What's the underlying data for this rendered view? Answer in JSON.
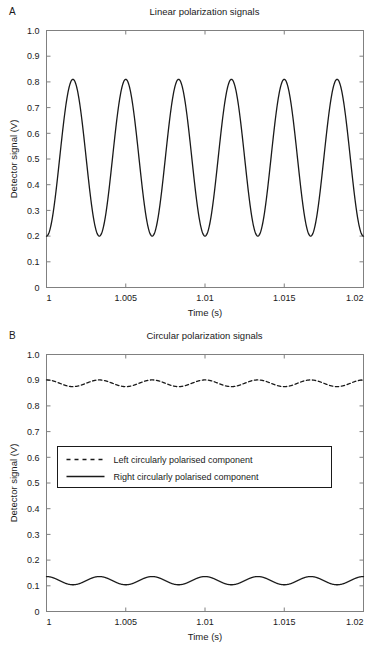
{
  "figure": {
    "width": 377,
    "height": 646,
    "background": "#ffffff",
    "line_color": "#1a1a1a",
    "axis_color": "#808080",
    "text_color": "#1a1a1a"
  },
  "panels": [
    {
      "label": "A",
      "title": "Linear polarization signals",
      "xlabel": "Time (s)",
      "ylabel": "Detector signal (V)"
    },
    {
      "label": "B",
      "title": "Circular polarization signals",
      "xlabel": "Time (s)",
      "ylabel": "Detector signal (V)"
    }
  ],
  "legend": {
    "items": [
      {
        "label": "Left circularly polarised component",
        "style": "dashed"
      },
      {
        "label": "Right circularly polarised component",
        "style": "solid"
      }
    ]
  },
  "chart_data": [
    {
      "type": "line",
      "panel": "A",
      "title": "Linear polarization signals",
      "xlabel": "Time (s)",
      "ylabel": "Detector signal (V)",
      "xlim": [
        1,
        1.02
      ],
      "ylim": [
        0,
        1.0
      ],
      "xticks": [
        1,
        1.005,
        1.01,
        1.015,
        1.02
      ],
      "xticklabels": [
        "1",
        "1.005",
        "1.01",
        "1.015",
        "1.02"
      ],
      "yticks": [
        0,
        0.1,
        0.2,
        0.3,
        0.4,
        0.5,
        0.6,
        0.7,
        0.8,
        0.9,
        1.0
      ],
      "yticklabels": [
        "0",
        "0.1",
        "0.2",
        "0.3",
        "0.4",
        "0.5",
        "0.6",
        "0.7",
        "0.8",
        "0.9",
        "1.0"
      ],
      "grid": false,
      "legend": "none",
      "series": [
        {
          "name": "Linear polarization detector signal",
          "style": "solid",
          "color": "#1a1a1a",
          "model": "sinusoid",
          "offset": 0.505,
          "amplitude": 0.305,
          "cycles": 6,
          "phase_deg": -90,
          "min": 0.2,
          "max": 0.81
        }
      ]
    },
    {
      "type": "line",
      "panel": "B",
      "title": "Circular polarization signals",
      "xlabel": "Time (s)",
      "ylabel": "Detector signal (V)",
      "xlim": [
        1,
        1.02
      ],
      "ylim": [
        0,
        1.0
      ],
      "xticks": [
        1,
        1.005,
        1.01,
        1.015,
        1.02
      ],
      "xticklabels": [
        "1",
        "1.005",
        "1.01",
        "1.015",
        "1.02"
      ],
      "yticks": [
        0,
        0.1,
        0.2,
        0.3,
        0.4,
        0.5,
        0.6,
        0.7,
        0.8,
        0.9,
        1.0
      ],
      "yticklabels": [
        "0",
        "0.1",
        "0.2",
        "0.3",
        "0.4",
        "0.5",
        "0.6",
        "0.7",
        "0.8",
        "0.9",
        "1.0"
      ],
      "grid": false,
      "legend": "center-left",
      "series": [
        {
          "name": "Left circularly polarised component",
          "style": "dashed",
          "color": "#1a1a1a",
          "model": "sinusoid",
          "offset": 0.888,
          "amplitude": 0.013,
          "cycles": 6,
          "phase_deg": 90,
          "min": 0.875,
          "max": 0.901
        },
        {
          "name": "Right circularly polarised component",
          "style": "solid",
          "color": "#1a1a1a",
          "model": "sinusoid",
          "offset": 0.12,
          "amplitude": 0.016,
          "cycles": 6,
          "phase_deg": 90,
          "min": 0.104,
          "max": 0.136
        }
      ]
    }
  ]
}
